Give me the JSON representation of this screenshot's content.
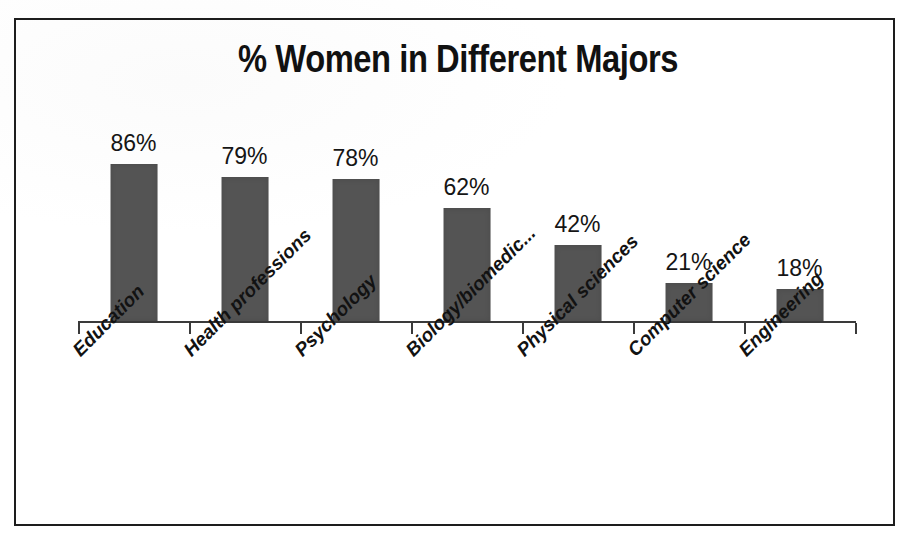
{
  "figure": {
    "title": "% Women in Different Majors",
    "frame_border_color": "#1d1d1d",
    "background_color": "#ffffff"
  },
  "chart_data": {
    "type": "bar",
    "title": "% Women in Different Majors",
    "xlabel": "",
    "ylabel": "",
    "ylim": [
      0,
      100
    ],
    "grid": false,
    "legend": null,
    "bar_color": "#545454",
    "value_suffix": "%",
    "categories": [
      "Education",
      "Health professions",
      "Psychology",
      "Biology/biomedic...",
      "Physical sciences",
      "Computer science",
      "Engineering"
    ],
    "values": [
      86,
      79,
      78,
      62,
      42,
      21,
      18
    ],
    "value_labels": [
      "86%",
      "79%",
      "78%",
      "62%",
      "42%",
      "21%",
      "18%"
    ]
  },
  "axis": {
    "tick_count": 8,
    "tick_color": "#3a3a3a",
    "line_color": "#3a3a3a"
  }
}
